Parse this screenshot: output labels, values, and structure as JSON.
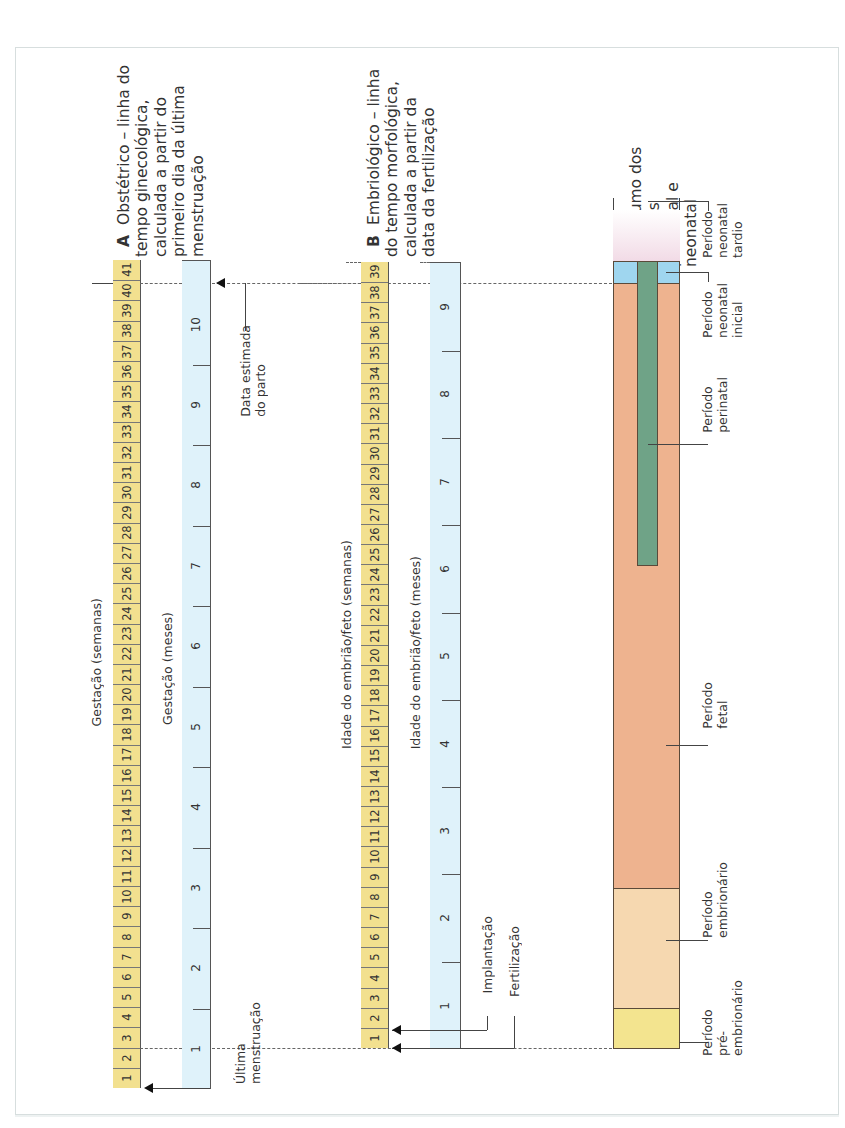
{
  "section_a": {
    "letter": "A",
    "title": "Obstétrico – linha do\ntempo ginecológica,\ncalculada a partir do\nprimeiro dia da última\nmenstruação",
    "weeks_axis_label": "Gestação (semanas)",
    "months_axis_label": "Gestação (meses)",
    "weeks": [
      "1",
      "2",
      "3",
      "4",
      "5",
      "6",
      "7",
      "8",
      "9",
      "10",
      "11",
      "12",
      "13",
      "14",
      "15",
      "16",
      "17",
      "18",
      "19",
      "20",
      "21",
      "22",
      "23",
      "24",
      "25",
      "26",
      "27",
      "28",
      "29",
      "30",
      "31",
      "32",
      "33",
      "34",
      "35",
      "36",
      "37",
      "38",
      "39",
      "40",
      "41"
    ],
    "months": [
      "1",
      "2",
      "3",
      "4",
      "5",
      "6",
      "7",
      "8",
      "9",
      "10"
    ],
    "annotation_due_date": "Data estimada\ndo parto",
    "annotation_last_period": "Última\nmenstruação"
  },
  "section_b": {
    "letter": "B",
    "title": "Embriológico – linha\ndo tempo morfológica,\ncalculada a partir da\ndata da fertilização",
    "weeks_axis_label": "Idade do embrião/feto (semanas)",
    "months_axis_label": "Idade do embrião/feto (meses)",
    "weeks": [
      "1",
      "2",
      "3",
      "4",
      "5",
      "6",
      "7",
      "8",
      "9",
      "10",
      "11",
      "12",
      "13",
      "14",
      "15",
      "16",
      "17",
      "18",
      "19",
      "20",
      "21",
      "22",
      "23",
      "24",
      "25",
      "26",
      "27",
      "28",
      "29",
      "30",
      "31",
      "32",
      "33",
      "34",
      "35",
      "36",
      "37",
      "38",
      "39"
    ],
    "months": [
      "1",
      "2",
      "3",
      "4",
      "5",
      "6",
      "7",
      "8",
      "9"
    ],
    "annotation_implantation": "Implantação",
    "annotation_fertilization": "Fertilização"
  },
  "section_c": {
    "letter": "C",
    "title": "Resumo dos\nestágios\npré-natal e\nneonatal",
    "periods": {
      "late_neonatal": "Período\nneonatal\ntardio",
      "early_neonatal": "Período\nneonatal\ninicial",
      "perinatal": "Período\nperinatal",
      "fetal": "Período\nfetal",
      "embryonic": "Período\nembrionário",
      "pre_embryonic": "Período\npré-\nembrionário"
    }
  },
  "colors": {
    "weeks_bar": "#f2e08f",
    "months_bar": "#dff2fa",
    "pre_embryonic": "#f3e48f",
    "embryonic": "#f6d8b0",
    "fetal": "#eeb38f",
    "early_neonatal": "#9fd6ef",
    "late_neonatal_top": "#fbf7fa",
    "late_neonatal_bottom": "#f2dbe6",
    "perinatal": "#6fa387"
  }
}
